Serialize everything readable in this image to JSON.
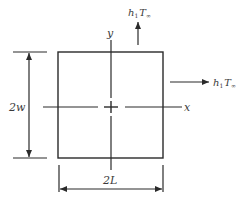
{
  "diagram": {
    "type": "2D rectangular cross-section with convective boundaries",
    "labels": {
      "y_axis": "y",
      "x_axis": "x",
      "height": "2w",
      "width": "2L",
      "conv_top": {
        "h": "h",
        "sub": "1",
        "T": "T",
        "Tsub": "∞"
      },
      "conv_right": {
        "h": "h",
        "sub": "1",
        "T": "T",
        "Tsub": "∞"
      }
    },
    "colors": {
      "line": "#2a2a2a",
      "text": "#3a3a3a",
      "background": "#ffffff"
    }
  }
}
